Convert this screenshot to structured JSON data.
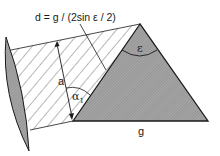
{
  "diagram": {
    "formula": "d = g / (2sin ε / 2)",
    "labels": {
      "a": "a",
      "alpha": "α",
      "alpha_sub": "1",
      "epsilon": "ε",
      "g": "g"
    },
    "colors": {
      "line": "#1a1a1a",
      "prism_fill": "#9a9a9a",
      "lens_fill": "#8c8c8c",
      "hatch": "#333333",
      "background": "#ffffff"
    }
  }
}
